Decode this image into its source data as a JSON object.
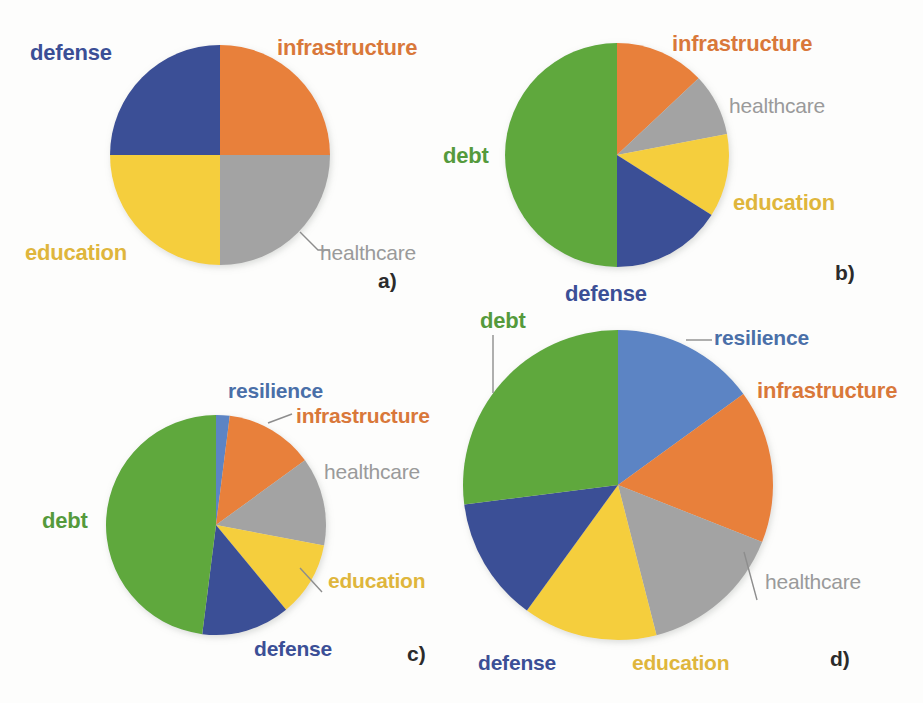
{
  "figure": {
    "background": "#fdfdfc",
    "caption_letters": [
      "a)",
      "b)",
      "c)",
      "d)"
    ]
  },
  "palette": {
    "defense": "#3b4f96",
    "infrastructure": "#e8803a",
    "education": "#f5ce3e",
    "healthcare": "#a3a3a3",
    "debt": "#5fa83e",
    "resilience": "#5b84c4"
  },
  "label_colors": {
    "defense": "#3b4f96",
    "infrastructure": "#d9783a",
    "education": "#dfb63c",
    "healthcare": "#9a9a9a",
    "debt": "#559a3c",
    "resilience": "#4a6fa8",
    "letter": "#2b2b2b",
    "leader": "#8d8d8d"
  },
  "labels": {
    "defense": "defense",
    "infrastructure": "infrastructure",
    "education": "education",
    "healthcare": "healthcare",
    "debt": "debt",
    "resilience": "resilience",
    "a": "a)",
    "b": "b)",
    "c": "c)",
    "d": "d)"
  },
  "chart_data": [
    {
      "id": "a",
      "type": "pie",
      "title": "a)",
      "center": [
        220,
        155
      ],
      "radius": 110,
      "start_angle": 0,
      "direction": "clockwise",
      "categories": [
        "infrastructure",
        "healthcare",
        "education",
        "defense"
      ],
      "values": [
        25,
        25,
        25,
        25
      ],
      "unit": "percent",
      "legend": "direct labels around pie",
      "grid": false
    },
    {
      "id": "b",
      "type": "pie",
      "title": "b)",
      "center": [
        617,
        155
      ],
      "radius": 112,
      "start_angle": 0,
      "direction": "clockwise",
      "categories": [
        "infrastructure",
        "healthcare",
        "education",
        "defense",
        "debt"
      ],
      "values": [
        13,
        9,
        12,
        16,
        50
      ],
      "unit": "percent",
      "legend": "direct labels around pie",
      "grid": false
    },
    {
      "id": "c",
      "type": "pie",
      "title": "c)",
      "center": [
        216,
        525
      ],
      "radius": 110,
      "start_angle": 0,
      "direction": "clockwise",
      "categories": [
        "resilience",
        "infrastructure",
        "healthcare",
        "education",
        "defense",
        "debt"
      ],
      "values": [
        2,
        13,
        13,
        11,
        13,
        48
      ],
      "unit": "percent",
      "legend": "direct labels around pie",
      "grid": false
    },
    {
      "id": "d",
      "type": "pie",
      "title": "d)",
      "center": [
        618,
        485
      ],
      "radius": 155,
      "start_angle": 0,
      "direction": "clockwise",
      "categories": [
        "resilience",
        "infrastructure",
        "healthcare",
        "education",
        "defense",
        "debt"
      ],
      "values": [
        15,
        16,
        15,
        14,
        13,
        27
      ],
      "unit": "percent",
      "legend": "direct labels around pie",
      "grid": false
    }
  ]
}
